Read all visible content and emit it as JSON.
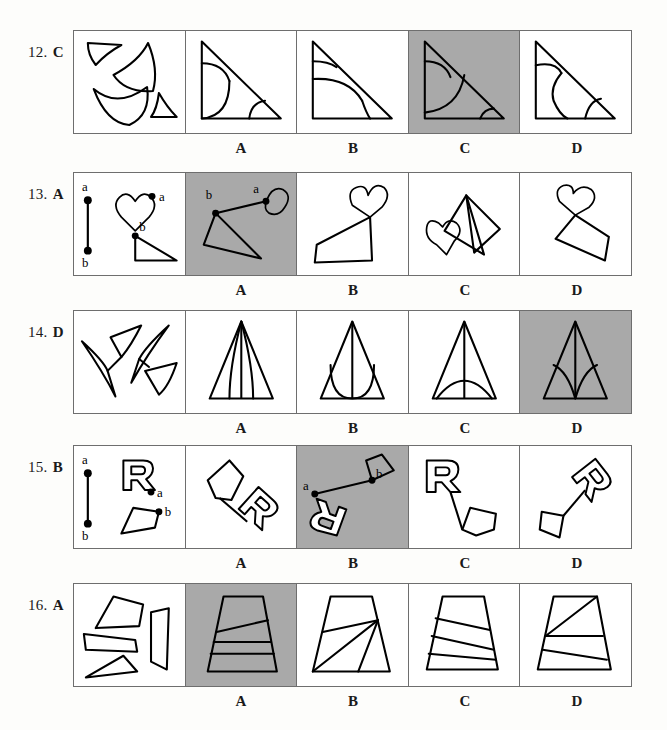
{
  "page": {
    "background_color": "#fdfdfb",
    "shaded_answer_color": "#a9a9a9",
    "border_color": "#6e6e6e",
    "ink_color": "#000000"
  },
  "option_letters": [
    "A",
    "B",
    "C",
    "D"
  ],
  "items": [
    {
      "number": "12.",
      "answer": "C",
      "correct_index": 2,
      "stimulus_description": "four curved fragments: small triangle-with-arc, large fan/wedge, crescent shape, small arc triangle",
      "options": [
        {
          "letter": "A",
          "shaded": false,
          "description": "right triangle with quarter arc at top-left and arc at bottom-right"
        },
        {
          "letter": "B",
          "shaded": false,
          "description": "right triangle with small top arc and large rounded region at bottom"
        },
        {
          "letter": "C",
          "shaded": true,
          "description": "right triangle with quarter arc top-left, large curve through middle, small arc bottom-right"
        },
        {
          "letter": "D",
          "shaded": false,
          "description": "right triangle with arc top-left, S-curve through middle and small arc bottom-right"
        }
      ]
    },
    {
      "number": "13.",
      "answer": "A",
      "correct_index": 0,
      "stimulus_description": "reference segment a-b, heart with point a, triangle with point b",
      "point_labels": [
        "a",
        "b"
      ],
      "options": [
        {
          "letter": "A",
          "shaded": true,
          "description": "heart at upper right joined by segment to triangle at lower left, labels a and b shown"
        },
        {
          "letter": "B",
          "shaded": false,
          "description": "heart upper right, zig-zag to flat triangle lower left"
        },
        {
          "letter": "C",
          "shaded": false,
          "description": "heart at left attached to tall triangle at right"
        },
        {
          "letter": "D",
          "shaded": false,
          "description": "heart at top, thin triangle below"
        }
      ]
    },
    {
      "number": "14.",
      "answer": "D",
      "correct_index": 3,
      "stimulus_description": "four thin curved sliver / dart shapes scattered",
      "options": [
        {
          "letter": "A",
          "shaded": false,
          "description": "tall triangle with vertical center line and two inner curved slivers"
        },
        {
          "letter": "B",
          "shaded": false,
          "description": "tall triangle with U-shaped inner curve and vertical line"
        },
        {
          "letter": "C",
          "shaded": false,
          "description": "tall triangle with vertical line and single wide arch"
        },
        {
          "letter": "D",
          "shaded": true,
          "description": "tall triangle with vertical line and two curved wings meeting at base center"
        }
      ]
    },
    {
      "number": "15.",
      "answer": "B",
      "correct_index": 1,
      "stimulus_description": "reference segment a-b, outlined letter R with point a, pentagon with point b",
      "point_labels": [
        "a",
        "b"
      ],
      "options": [
        {
          "letter": "A",
          "shaded": false,
          "description": "pentagon upper left connected by line to rotated R lower right"
        },
        {
          "letter": "B",
          "shaded": true,
          "description": "rotated R lower left at point a, line to pentagon upper right at point b"
        },
        {
          "letter": "C",
          "shaded": false,
          "description": "upright R upper left, line down to pentagon lower right"
        },
        {
          "letter": "D",
          "shaded": false,
          "description": "pentagon lower left, line up to rotated R upper right"
        }
      ]
    },
    {
      "number": "16.",
      "answer": "A",
      "correct_index": 0,
      "stimulus_description": "four quadrilateral strips of varying shape",
      "options": [
        {
          "letter": "A",
          "shaded": true,
          "description": "trapezoid divided by one slanted and two near-horizontal lines"
        },
        {
          "letter": "B",
          "shaded": false,
          "description": "trapezoid with lines radiating from a point on the right edge"
        },
        {
          "letter": "C",
          "shaded": false,
          "description": "trapezoid with three slanted parallel-ish dividing lines"
        },
        {
          "letter": "D",
          "shaded": false,
          "description": "trapezoid with diagonal from lower-left to top-right plus two horizontals"
        }
      ]
    }
  ]
}
